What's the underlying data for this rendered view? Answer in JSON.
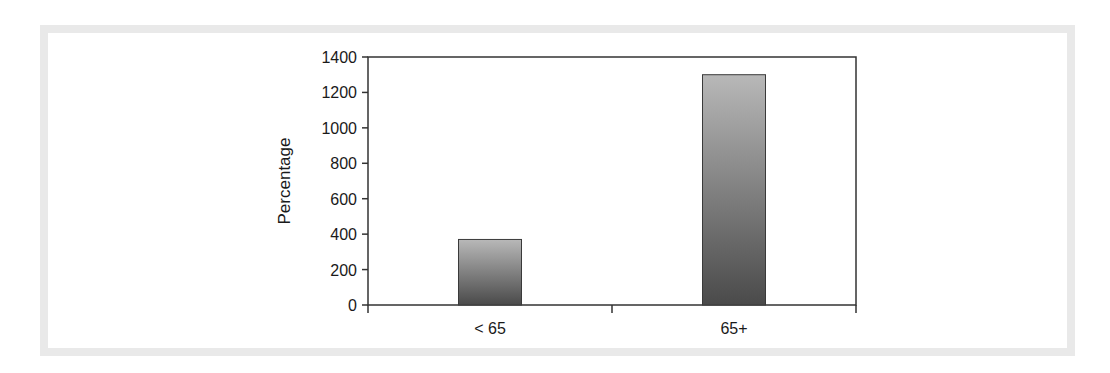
{
  "chart_data": {
    "type": "bar",
    "title": "",
    "xlabel": "",
    "ylabel": "Percentage",
    "categories": [
      "< 65",
      "65+"
    ],
    "values": [
      370,
      1300
    ],
    "ylim": [
      0,
      1400
    ],
    "yticks": [
      0,
      200,
      400,
      600,
      800,
      1000,
      1200,
      1400
    ],
    "grid": false,
    "legend": null,
    "bar_style": "vertical gray gradient (light top to dark bottom)",
    "colors": {
      "bar_top": "#b8b8b8",
      "bar_bottom": "#4a4a4a",
      "axis": "#333333",
      "frame": "#e9e9e9"
    }
  },
  "labels": {
    "ylabel": "Percentage",
    "yticks": [
      "0",
      "200",
      "400",
      "600",
      "800",
      "1000",
      "1200",
      "1400"
    ],
    "categories": [
      "< 65",
      "65+"
    ]
  }
}
